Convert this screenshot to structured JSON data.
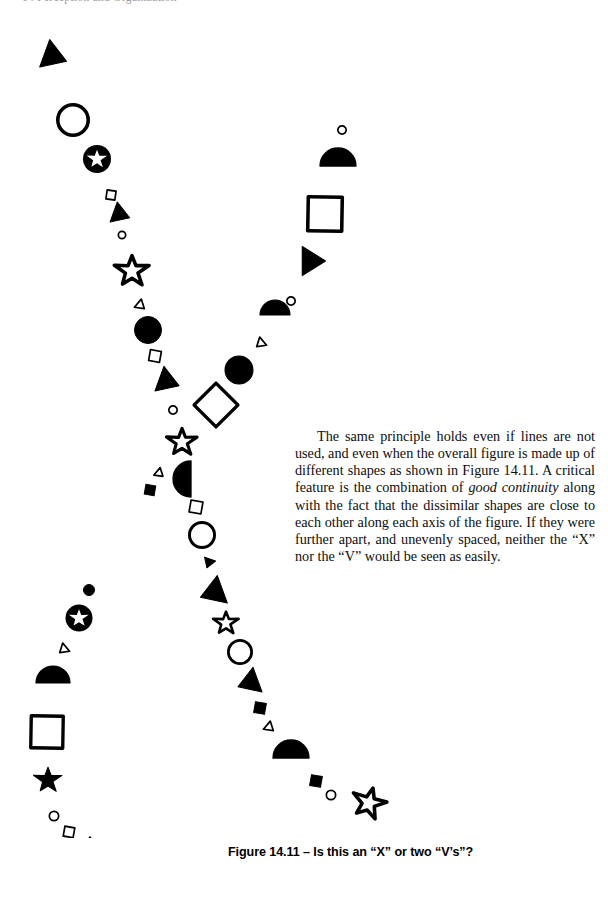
{
  "page": {
    "width": 608,
    "height": 911,
    "background": "#ffffff",
    "ink": "#000000"
  },
  "running_head": {
    "text": "14  Perception and Organization"
  },
  "body_text": {
    "paragraph": "The same principle holds even if lines are not used, and even when the overall figure is made up of different shapes as shown in Figure 14.11. A critical feature is the combination of ",
    "emphasis": "good continuity",
    "paragraph_tail": " along with the fact that the dissimilar shapes are close to each other along each axis of the figure. If they were further apart, and unevenly spaced, neither the “X” nor the “V” would be seen as easily."
  },
  "figure": {
    "caption": "Figure 14.11 – Is this an “X” or two “V’s”?",
    "label": "Figure 14.11",
    "question": "Is this an “X” or two “V’s”?",
    "stroke_color": "#000000",
    "fill_color": "#000000",
    "shapes": [
      {
        "name": "filled-triangle-right",
        "type": "triangle",
        "fill": "solid",
        "x": 52,
        "y": 38,
        "size": 30,
        "rot": 110
      },
      {
        "name": "open-circle",
        "type": "circle",
        "fill": "open",
        "x": 73,
        "y": 102,
        "size": 34,
        "rot": 0
      },
      {
        "name": "filled-circle-with-star",
        "type": "circle-star",
        "fill": "solid",
        "x": 97,
        "y": 141,
        "size": 28,
        "rot": 0
      },
      {
        "name": "small-open-square",
        "type": "square",
        "fill": "open",
        "x": 111,
        "y": 177,
        "size": 9,
        "rot": 8
      },
      {
        "name": "filled-triangle-right-2",
        "type": "triangle",
        "fill": "solid",
        "x": 119,
        "y": 196,
        "size": 22,
        "rot": 110
      },
      {
        "name": "small-open-circle",
        "type": "circle",
        "fill": "open",
        "x": 122,
        "y": 217,
        "size": 9,
        "rot": 0
      },
      {
        "name": "open-star",
        "type": "star",
        "fill": "open",
        "x": 132,
        "y": 253,
        "size": 34,
        "rot": 0
      },
      {
        "name": "tiny-open-triangle",
        "type": "triangle",
        "fill": "open",
        "x": 140,
        "y": 287,
        "size": 11,
        "rot": 130
      },
      {
        "name": "filled-circle",
        "type": "circle",
        "fill": "solid",
        "x": 148,
        "y": 312,
        "size": 27,
        "rot": 0
      },
      {
        "name": "small-open-square-2",
        "type": "square",
        "fill": "open",
        "x": 155,
        "y": 338,
        "size": 11,
        "rot": 10
      },
      {
        "name": "filled-triangle-right-3",
        "type": "triangle",
        "fill": "solid",
        "x": 166,
        "y": 363,
        "size": 27,
        "rot": 110
      },
      {
        "name": "small-open-circle-2",
        "type": "circle",
        "fill": "open",
        "x": 173,
        "y": 392,
        "size": 10,
        "rot": 0
      },
      {
        "name": "open-star-2",
        "type": "star",
        "fill": "open",
        "x": 182,
        "y": 424,
        "size": 30,
        "rot": 0
      },
      {
        "name": "tiny-open-triangle-2",
        "type": "triangle",
        "fill": "open",
        "x": 159,
        "y": 455,
        "size": 10,
        "rot": 130
      },
      {
        "name": "small-filled-square",
        "type": "square",
        "fill": "solid",
        "x": 150,
        "y": 472,
        "size": 10,
        "rot": 10
      },
      {
        "name": "filled-half-disc-down",
        "type": "halfdisc",
        "fill": "solid",
        "x": 191,
        "y": 461,
        "size": 36,
        "rot": 180
      },
      {
        "name": "small-open-square-3",
        "type": "square",
        "fill": "open",
        "x": 196,
        "y": 489,
        "size": 12,
        "rot": 10
      },
      {
        "name": "open-circle-2",
        "type": "circle",
        "fill": "open",
        "x": 202,
        "y": 517,
        "size": 28,
        "rot": 0
      },
      {
        "name": "small-filled-triangle",
        "type": "triangle",
        "fill": "solid",
        "x": 209,
        "y": 544,
        "size": 12,
        "rot": 200
      },
      {
        "name": "filled-triangle-left",
        "type": "triangle",
        "fill": "solid",
        "x": 215,
        "y": 574,
        "size": 30,
        "rot": 250
      },
      {
        "name": "open-star-3",
        "type": "star",
        "fill": "open",
        "x": 226,
        "y": 605,
        "size": 25,
        "rot": 0
      },
      {
        "name": "open-circle-3",
        "type": "circle",
        "fill": "open",
        "x": 240,
        "y": 634,
        "size": 26,
        "rot": 0
      },
      {
        "name": "filled-triangle-left-2",
        "type": "triangle",
        "fill": "solid",
        "x": 251,
        "y": 664,
        "size": 27,
        "rot": 250
      },
      {
        "name": "small-filled-square-2",
        "type": "square",
        "fill": "solid",
        "x": 260,
        "y": 690,
        "size": 11,
        "rot": 10
      },
      {
        "name": "tiny-open-triangle-3",
        "type": "triangle",
        "fill": "open",
        "x": 269,
        "y": 709,
        "size": 11,
        "rot": 130
      },
      {
        "name": "filled-half-disc-right",
        "type": "halfdisc",
        "fill": "solid",
        "x": 291,
        "y": 740,
        "size": 36,
        "rot": 270
      },
      {
        "name": "small-filled-square-3",
        "type": "square",
        "fill": "solid",
        "x": 316,
        "y": 763,
        "size": 11,
        "rot": 10
      },
      {
        "name": "small-open-circle-3",
        "type": "circle",
        "fill": "open",
        "x": 331,
        "y": 777,
        "size": 11,
        "rot": 0
      },
      {
        "name": "open-star-4",
        "type": "star",
        "fill": "open",
        "x": 369,
        "y": 785,
        "size": 34,
        "rot": 15
      },
      {
        "name": "small-open-circle-top-right",
        "type": "circle",
        "fill": "open",
        "x": 342,
        "y": 112,
        "size": 10,
        "rot": 0
      },
      {
        "name": "filled-half-disc-right-2",
        "type": "halfdisc",
        "fill": "solid",
        "x": 338,
        "y": 148,
        "size": 36,
        "rot": 270
      },
      {
        "name": "open-square-right",
        "type": "square",
        "fill": "open",
        "x": 325,
        "y": 196,
        "size": 34,
        "rot": 1
      },
      {
        "name": "filled-triangle-right-4",
        "type": "triangle",
        "fill": "solid",
        "x": 310,
        "y": 243,
        "size": 30,
        "rot": 90
      },
      {
        "name": "small-open-circle-right",
        "type": "circle",
        "fill": "open",
        "x": 291,
        "y": 283,
        "size": 10,
        "rot": 0
      },
      {
        "name": "filled-half-disc-right-3",
        "type": "halfdisc",
        "fill": "solid",
        "x": 275,
        "y": 297,
        "size": 30,
        "rot": 270
      },
      {
        "name": "tiny-open-triangle-right",
        "type": "triangle",
        "fill": "open",
        "x": 261,
        "y": 325,
        "size": 11,
        "rot": 230
      },
      {
        "name": "filled-circle-mid",
        "type": "circle",
        "fill": "solid",
        "x": 239,
        "y": 352,
        "size": 28,
        "rot": 0
      },
      {
        "name": "open-diamond",
        "type": "square",
        "fill": "open",
        "x": 216,
        "y": 387,
        "size": 31,
        "rot": 45
      },
      {
        "name": "small-filled-circle-lower-left",
        "type": "circle",
        "fill": "solid",
        "x": 89,
        "y": 572,
        "size": 11,
        "rot": 0
      },
      {
        "name": "filled-circle-with-star-2",
        "type": "circle-star",
        "fill": "solid",
        "x": 79,
        "y": 600,
        "size": 27,
        "rot": 0
      },
      {
        "name": "tiny-open-triangle-left",
        "type": "triangle",
        "fill": "open",
        "x": 64,
        "y": 631,
        "size": 11,
        "rot": 230
      },
      {
        "name": "filled-half-disc-left",
        "type": "halfdisc",
        "fill": "solid",
        "x": 53,
        "y": 665,
        "size": 34,
        "rot": 270
      },
      {
        "name": "open-square-left",
        "type": "square",
        "fill": "open",
        "x": 47,
        "y": 714,
        "size": 32,
        "rot": 1
      },
      {
        "name": "filled-star",
        "type": "star",
        "fill": "solid",
        "x": 48,
        "y": 762,
        "size": 28,
        "rot": 0
      },
      {
        "name": "small-open-circle-bottom",
        "type": "circle",
        "fill": "open",
        "x": 54,
        "y": 798,
        "size": 11,
        "rot": 0
      },
      {
        "name": "tiny-open-square-bottom",
        "type": "square",
        "fill": "open",
        "x": 69,
        "y": 814,
        "size": 10,
        "rot": 10
      },
      {
        "name": "open-star-bottom",
        "type": "star",
        "fill": "open",
        "x": 90,
        "y": 830,
        "size": 23,
        "rot": 0
      },
      {
        "name": "open-circle-bottom",
        "type": "circle",
        "fill": "open",
        "x": 121,
        "y": 846,
        "size": 30,
        "rot": 0
      }
    ]
  }
}
